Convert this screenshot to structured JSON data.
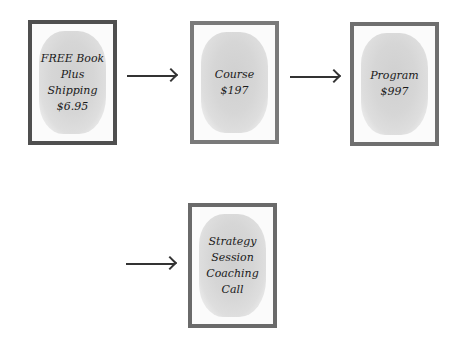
{
  "cards": [
    {
      "id": "book",
      "label": "FREE Book\nPlus\nShipping\n$6.95",
      "border": "#4f4f4f"
    },
    {
      "id": "course",
      "label": "Course\n$197",
      "border": "#7a7a7a"
    },
    {
      "id": "program",
      "label": "Program\n$997",
      "border": "#6f6f6f"
    },
    {
      "id": "strategy",
      "label": "Strategy\nSession\nCoaching\nCall",
      "border": "#6a6a6a"
    }
  ],
  "arrows": [
    "book-to-course",
    "course-to-program",
    "to-strategy-session"
  ]
}
